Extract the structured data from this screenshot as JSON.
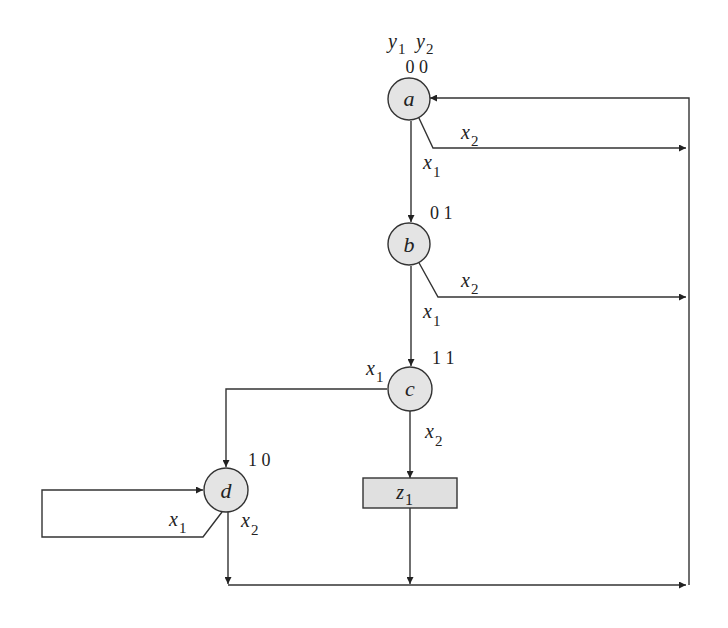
{
  "diagram": {
    "type": "asm-chart",
    "state_variable_header": {
      "v1": "y",
      "v1_sub": "1",
      "v2": "y",
      "v2_sub": "2"
    },
    "states": [
      {
        "id": "a",
        "label": "a",
        "code": "0 0"
      },
      {
        "id": "b",
        "label": "b",
        "code": "0 1"
      },
      {
        "id": "c",
        "label": "c",
        "code": "1 1"
      },
      {
        "id": "d",
        "label": "d",
        "code": "1 0"
      }
    ],
    "outputs": [
      {
        "id": "z1",
        "label": "z",
        "sub": "1"
      }
    ],
    "edge_labels": {
      "a_x1": {
        "v": "x",
        "sub": "1"
      },
      "a_x2": {
        "v": "x",
        "sub": "2"
      },
      "b_x1": {
        "v": "x",
        "sub": "1"
      },
      "b_x2": {
        "v": "x",
        "sub": "2"
      },
      "c_x1": {
        "v": "x",
        "sub": "1"
      },
      "c_x2": {
        "v": "x",
        "sub": "2"
      },
      "d_x1": {
        "v": "x",
        "sub": "1"
      },
      "d_x2": {
        "v": "x",
        "sub": "2"
      }
    },
    "transitions": [
      {
        "from": "a",
        "to": "b",
        "condition": "x1"
      },
      {
        "from": "a",
        "to": "a",
        "condition": "x2"
      },
      {
        "from": "b",
        "to": "c",
        "condition": "x1"
      },
      {
        "from": "b",
        "to": "a",
        "condition": "x2"
      },
      {
        "from": "c",
        "to": "d",
        "condition": "x1"
      },
      {
        "from": "c",
        "to": "z1",
        "condition": "x2"
      },
      {
        "from": "z1",
        "to": "a",
        "condition": ""
      },
      {
        "from": "d",
        "to": "d",
        "condition": "x1"
      },
      {
        "from": "d",
        "to": "a",
        "condition": "x2"
      }
    ],
    "colors": {
      "node_fill": "#e4e4e4",
      "box_fill": "#e0e0e0",
      "stroke": "#333333",
      "background": "#ffffff"
    }
  }
}
